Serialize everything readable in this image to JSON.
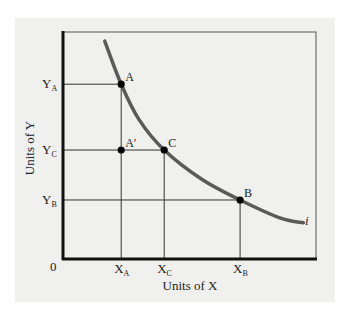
{
  "chart_data": {
    "type": "line",
    "title": "",
    "xlabel": "Units of X",
    "ylabel": "Units of Y",
    "xlim": [
      0,
      10
    ],
    "ylim": [
      0,
      10
    ],
    "origin_label": "0",
    "curve": {
      "name": "i",
      "points": [
        [
          1.65,
          9.6
        ],
        [
          2.3,
          7.7
        ],
        [
          3.0,
          6.15
        ],
        [
          4.0,
          4.8
        ],
        [
          5.5,
          3.5
        ],
        [
          7.0,
          2.6
        ],
        [
          8.6,
          1.8
        ],
        [
          9.5,
          1.6
        ]
      ]
    },
    "x_ticks": [
      {
        "label": "X",
        "sub": "A",
        "value": 2.3
      },
      {
        "label": "X",
        "sub": "C",
        "value": 4.0
      },
      {
        "label": "X",
        "sub": "B",
        "value": 7.0
      }
    ],
    "y_ticks": [
      {
        "label": "Y",
        "sub": "A",
        "value": 7.7
      },
      {
        "label": "Y",
        "sub": "C",
        "value": 4.8
      },
      {
        "label": "Y",
        "sub": "B",
        "value": 2.6
      }
    ],
    "points": [
      {
        "label": "A",
        "x": 2.3,
        "y": 7.7
      },
      {
        "label": "A′",
        "x": 2.3,
        "y": 4.8
      },
      {
        "label": "C",
        "x": 4.0,
        "y": 4.8
      },
      {
        "label": "B",
        "x": 7.0,
        "y": 2.6
      }
    ],
    "guide_lines": [
      {
        "type": "h",
        "y": 7.7,
        "x_from": 0,
        "x_to": 2.3
      },
      {
        "type": "h",
        "y": 4.8,
        "x_from": 0,
        "x_to": 4.0
      },
      {
        "type": "h",
        "y": 2.6,
        "x_from": 0,
        "x_to": 7.0
      },
      {
        "type": "v",
        "x": 2.3,
        "y_from": 0,
        "y_to": 7.7
      },
      {
        "type": "v",
        "x": 4.0,
        "y_from": 0,
        "y_to": 4.8
      },
      {
        "type": "v",
        "x": 7.0,
        "y_from": 0,
        "y_to": 2.6
      }
    ],
    "colors": {
      "curve": "#5a5a5a",
      "axis": "#111111",
      "guide": "#333333",
      "point": "#000000",
      "background": "#f0f0ee"
    },
    "grid": false,
    "legend": "none"
  }
}
